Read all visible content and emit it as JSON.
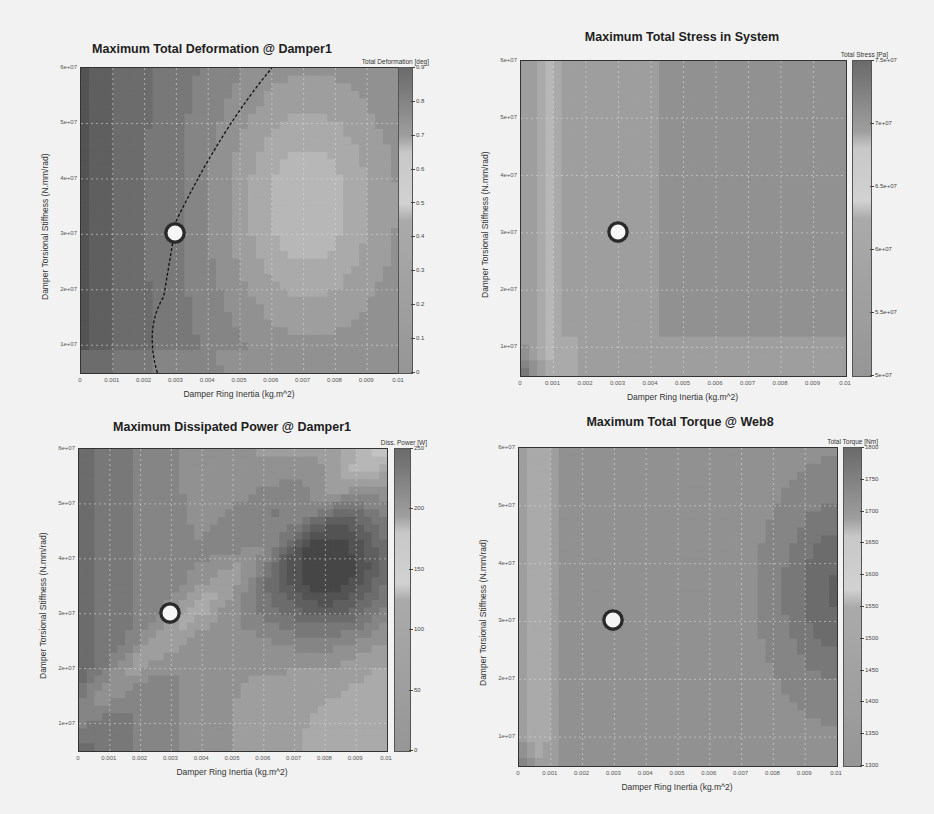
{
  "chart_data": [
    {
      "type": "heatmap",
      "title": "Maximum Total Deformation @ Damper1",
      "xlabel": "Damper Ring Inertia (kg.m^2)",
      "ylabel": "Damper Torsional Stiffness (N.mm/rad)",
      "xlim": [
        0,
        0.01
      ],
      "ylim": [
        5000000,
        60000000
      ],
      "xticks": [
        "0",
        "0.001",
        "0.002",
        "0.003",
        "0.004",
        "0.005",
        "0.006",
        "0.007",
        "0.008",
        "0.009",
        "0.01"
      ],
      "yticks": [
        "1e+07",
        "2e+07",
        "3e+07",
        "4e+07",
        "5e+07",
        "6e+07"
      ],
      "colorbar": {
        "title": "Total Deformation [deg]",
        "min": 0,
        "max": 0.9,
        "ticks": [
          "0",
          "0.1",
          "0.2",
          "0.3",
          "0.4",
          "0.5",
          "0.6",
          "0.7",
          "0.8",
          "0.9"
        ]
      },
      "grid": true,
      "marker": {
        "x": 0.003,
        "y": 30000000
      },
      "annotations": [
        "dashed contour line from (0.0025, 5e+06) curving to (0.006, 6e+07)"
      ],
      "features": "high values (~0.8) at low inertia left region; low values (~0.3) in island centered near (0.007, 3.5e+07)"
    },
    {
      "type": "heatmap",
      "title": "Maximum Total Stress in System",
      "xlabel": "Damper Ring Inertia (kg.m^2)",
      "ylabel": "Damper Torsional Stiffness (N.mm/rad)",
      "xlim": [
        0,
        0.01
      ],
      "ylim": [
        5000000,
        60000000
      ],
      "xticks": [
        "0",
        "0.001",
        "0.002",
        "0.003",
        "0.004",
        "0.005",
        "0.006",
        "0.007",
        "0.008",
        "0.009",
        "0.01"
      ],
      "yticks": [
        "1e+07",
        "2e+07",
        "3e+07",
        "4e+07",
        "5e+07",
        "6e+07"
      ],
      "colorbar": {
        "title": "Total Stress [Pa]",
        "min": 50000000,
        "max": 75000000,
        "ticks": [
          "5e+07",
          "5.5e+07",
          "6e+07",
          "6.5e+07",
          "7e+07",
          "7.5e+07"
        ]
      },
      "grid": true,
      "marker": {
        "x": 0.003,
        "y": 30000000
      },
      "features": "mostly ~6e+07 plateau; lighter band near x=0.0005-0.001; darker low corner near origin"
    },
    {
      "type": "heatmap",
      "title": "Maximum Dissipated Power @ Damper1",
      "xlabel": "Damper Ring Inertia (kg.m^2)",
      "ylabel": "Damper Torsional Stiffness (N.mm/rad)",
      "xlim": [
        0,
        0.01
      ],
      "ylim": [
        5000000,
        60000000
      ],
      "xticks": [
        "0",
        "0.001",
        "0.002",
        "0.003",
        "0.004",
        "0.005",
        "0.006",
        "0.007",
        "0.008",
        "0.009",
        "0.01"
      ],
      "yticks": [
        "1e+07",
        "2e+07",
        "3e+07",
        "4e+07",
        "5e+07",
        "6e+07"
      ],
      "colorbar": {
        "title": "Diss. Power [W]",
        "min": 0,
        "max": 250,
        "ticks": [
          "0",
          "50",
          "100",
          "150",
          "200",
          "250"
        ]
      },
      "grid": true,
      "marker": {
        "x": 0.003,
        "y": 30000000
      },
      "features": "peak ~230 W near (0.008, 4e+07); light ridge band diagonally; dark left region"
    },
    {
      "type": "heatmap",
      "title": "Maximum Total Torque @ Web8",
      "xlabel": "Damper Ring Inertia (kg.m^2)",
      "ylabel": "Damper Torsional Stiffness (N.mm/rad)",
      "xlim": [
        0,
        0.01
      ],
      "ylim": [
        5000000,
        60000000
      ],
      "xticks": [
        "0",
        "0.001",
        "0.002",
        "0.003",
        "0.004",
        "0.005",
        "0.006",
        "0.007",
        "0.008",
        "0.009",
        "0.01"
      ],
      "yticks": [
        "1e+07",
        "2e+07",
        "3e+07",
        "4e+07",
        "5e+07",
        "6e+07"
      ],
      "colorbar": {
        "title": "Total Torque [Nm]",
        "min": 1300,
        "max": 1800,
        "ticks": [
          "1300",
          "1350",
          "1400",
          "1450",
          "1500",
          "1550",
          "1600",
          "1650",
          "1700",
          "1750",
          "1800"
        ]
      },
      "grid": true,
      "marker": {
        "x": 0.003,
        "y": 30000000
      },
      "features": "mostly ~1550 Nm; darker region near right edge around (0.0095, 3.5e+07); light band at x~0.0005"
    }
  ]
}
